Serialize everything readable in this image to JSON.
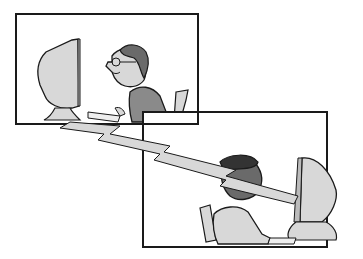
{
  "illustration": {
    "description": "Cartoon of two people at computers connected by a lightning-bolt shaped network link",
    "panels": [
      {
        "name": "top-left-panel",
        "subject": "man with glasses at computer"
      },
      {
        "name": "bottom-right-panel",
        "subject": "boy at computer"
      }
    ],
    "colors": {
      "outline": "#1a1a1a",
      "light_gray": "#d4d4d4",
      "mid_gray": "#8a8a8a",
      "dark_gray": "#555555",
      "background": "#ffffff"
    }
  }
}
